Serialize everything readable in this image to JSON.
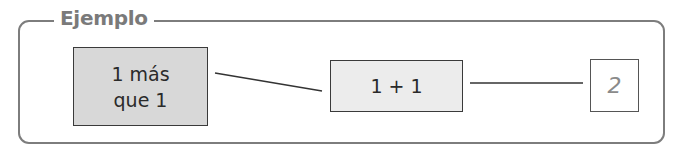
{
  "title": "Ejemplo",
  "boxes": [
    {
      "line1": "1 más",
      "line2": "que 1",
      "fill": "#d8d8d8"
    },
    {
      "text": "1 + 1",
      "fill": "#ececec"
    },
    {
      "text": "2",
      "fill": "#ffffff"
    }
  ],
  "connectors": [
    {
      "from": "box-1",
      "to": "box-2"
    },
    {
      "from": "box-2",
      "to": "box-3"
    }
  ],
  "colors": {
    "frame": "#7d7d7d",
    "title": "#7a7a7a",
    "answer": "#8a8a8a"
  }
}
